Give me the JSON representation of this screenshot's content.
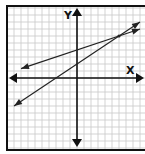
{
  "chart_data": {
    "type": "line",
    "title": "",
    "xlabel": "X",
    "ylabel": "Y",
    "xlim": [
      -10,
      10
    ],
    "ylim": [
      -10,
      10
    ],
    "grid": true,
    "grid_step": 1,
    "series": [
      {
        "name": "line-1",
        "equation": "y = x/3 + 4",
        "slope": 0.3333,
        "intercept": 4,
        "x_range": [
          -8,
          9
        ]
      },
      {
        "name": "line-2",
        "equation": "y = 2x/3 + 2",
        "slope": 0.6667,
        "intercept": 2,
        "x_range": [
          -9,
          9
        ]
      }
    ],
    "intersection": [
      6,
      6
    ]
  },
  "colors": {
    "grid": "#c8c8c8",
    "axis": "#111111",
    "line": "#222222",
    "frame": "#111111"
  }
}
